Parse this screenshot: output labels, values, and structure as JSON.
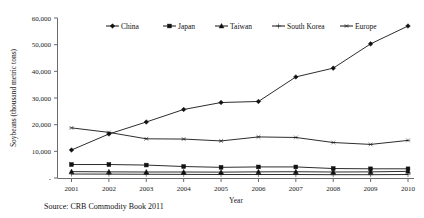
{
  "chart_data": {
    "type": "line",
    "title": "",
    "xlabel": "Year",
    "ylabel": "Soybeans (thousand metric tons)",
    "categories": [
      "2001",
      "2002",
      "2003",
      "2004",
      "2005",
      "2006",
      "2007",
      "2008",
      "2009",
      "2010"
    ],
    "x": [
      2001,
      2002,
      2003,
      2004,
      2005,
      2006,
      2007,
      2008,
      2009,
      2010
    ],
    "xlim": [
      2001,
      2010
    ],
    "ylim": [
      0,
      60000
    ],
    "yticks": [
      0,
      10000,
      20000,
      30000,
      40000,
      50000,
      60000
    ],
    "ytick_labels": [
      "-",
      "10,000",
      "20,000",
      "30,000",
      "40,000",
      "50,000",
      "60,000"
    ],
    "grid": false,
    "legend_position": "top-center",
    "series": [
      {
        "name": "China",
        "marker": "diamond",
        "values": [
          10500,
          16500,
          21000,
          25700,
          28300,
          28700,
          37900,
          41200,
          50300,
          57000
        ]
      },
      {
        "name": "Japan",
        "marker": "square",
        "values": [
          5050,
          5050,
          4850,
          4300,
          4000,
          4150,
          4150,
          3550,
          3450,
          3450
        ]
      },
      {
        "name": "Taiwan",
        "marker": "triangle",
        "values": [
          2400,
          2300,
          2250,
          2250,
          2200,
          2300,
          2350,
          2250,
          2300,
          2500
        ]
      },
      {
        "name": "South Korea",
        "marker": "cross",
        "values": [
          1500,
          1450,
          1400,
          1350,
          1300,
          1300,
          1300,
          1250,
          1250,
          1300
        ]
      },
      {
        "name": "Europe",
        "marker": "asterisk",
        "values": [
          18800,
          17100,
          14700,
          14600,
          13900,
          15400,
          15200,
          13300,
          12600,
          14100
        ]
      }
    ]
  },
  "axes": {
    "y_title": "Soybeans (thousand metric tons)",
    "x_title": "Year"
  },
  "legend": {
    "items": [
      {
        "label": "China"
      },
      {
        "label": "Japan"
      },
      {
        "label": "Taiwan"
      },
      {
        "label": "South Korea"
      },
      {
        "label": "Europe"
      }
    ]
  },
  "footer": {
    "source": "Source: CRB Commodity Book 2011"
  },
  "colors": {
    "series_stroke": "#151515",
    "axis": "#6b6b6b",
    "background": "#ffffff"
  }
}
